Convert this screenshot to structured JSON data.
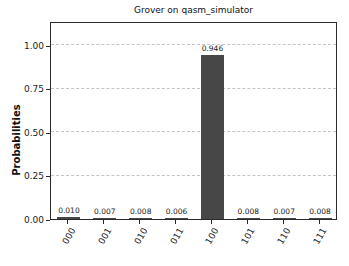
{
  "chart_data": {
    "type": "bar",
    "title": "Grover on qasm_simulator",
    "xlabel": "",
    "ylabel": "Probabilities",
    "categories": [
      "000",
      "001",
      "010",
      "011",
      "100",
      "101",
      "110",
      "111"
    ],
    "values": [
      0.01,
      0.007,
      0.008,
      0.006,
      0.946,
      0.008,
      0.007,
      0.008
    ],
    "bar_value_labels": [
      "0.010",
      "0.007",
      "0.008",
      "0.006",
      "0.946",
      "0.008",
      "0.007",
      "0.008"
    ],
    "yticks": [
      0.0,
      0.25,
      0.5,
      0.75,
      1.0
    ],
    "ytick_labels": [
      "0.00",
      "0.25",
      "0.50",
      "0.75",
      "1.00"
    ],
    "ylim": [
      0,
      1.14
    ],
    "grid": "horizontal-dashed",
    "legend": "none",
    "bar_color": "#474747",
    "axis_color": "#2b2b2b",
    "grid_color": "#c4c4c4",
    "text_color": "#1a1a1a",
    "background_color": "#ffffff"
  }
}
